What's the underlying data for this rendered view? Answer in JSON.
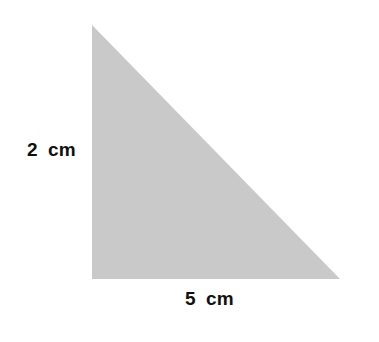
{
  "figure": {
    "shape": "right-triangle",
    "fill_color": "#c9c9c9",
    "vertices": [
      [
        92,
        25
      ],
      [
        92,
        279
      ],
      [
        340,
        279
      ]
    ],
    "labels": {
      "height": "2  cm",
      "base": "5  cm"
    }
  }
}
